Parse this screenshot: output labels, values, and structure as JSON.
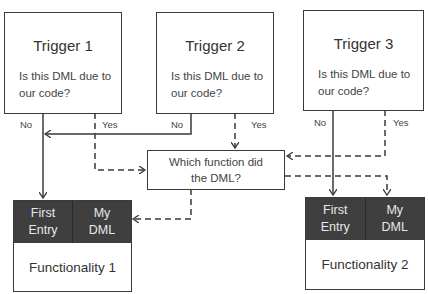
{
  "triggers": [
    {
      "title": "Trigger 1",
      "question": "Is this DML due to our code?",
      "no_label": "No",
      "yes_label": "Yes"
    },
    {
      "title": "Trigger 2",
      "question": "Is this DML due to our code?",
      "no_label": "No",
      "yes_label": "Yes"
    },
    {
      "title": "Trigger 3",
      "question": "Is this DML due to our code?",
      "no_label": "No",
      "yes_label": "Yes"
    }
  ],
  "decision": {
    "text": "Which function did the DML?"
  },
  "functionalities": [
    {
      "name": "Functionality 1",
      "cells": [
        "First Entry",
        "My DML"
      ]
    },
    {
      "name": "Functionality 2",
      "cells": [
        "First Entry",
        "My DML"
      ]
    }
  ],
  "legend": {
    "solid_line": "No path (not our code) → First Entry",
    "dashed_line": "Yes path (our code) → Which function → My DML"
  },
  "colors": {
    "line": "#3a3a3a",
    "header_fill": "#3f3f3f",
    "header_text": "#e8e8e8"
  }
}
